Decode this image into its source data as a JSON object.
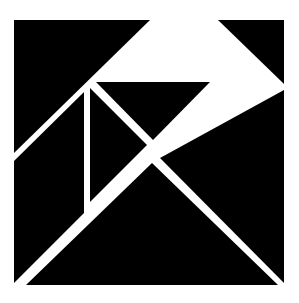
{
  "figure": {
    "canvas": {
      "width": 299,
      "height": 303,
      "background_color": "#ffffff",
      "piece_color": "#000000",
      "gap_color": "#ffffff"
    },
    "square_bounds": {
      "left": 9,
      "top": 13,
      "right": 288,
      "bottom": 290
    },
    "key_vertices": {
      "top_left": "9,13",
      "top_right": "288,13",
      "bottom_left": "9,290",
      "bottom_right": "288,290",
      "center": "152,152",
      "upper_notch": "90,85",
      "upper_right_vee": "215,78",
      "left_edge_notch": "9,155",
      "vertical_line_x": "78"
    },
    "pieces": [
      {
        "name": "large-triangle-upper-left",
        "label": "Large triangle (upper left)",
        "points": "14,20 150,20 14,153"
      },
      {
        "name": "medium-triangle-upper-right",
        "label": "Medium triangle (upper right)",
        "points": "218,20 284,20 284,84"
      },
      {
        "name": "small-triangle-top",
        "label": "Small triangle (top center)",
        "points": "96,82 210,82 153,140"
      },
      {
        "name": "parallelogram-left",
        "label": "Parallelogram (left column)",
        "points": "84,92 84,213 14,283 14,161"
      },
      {
        "name": "square-piece-center",
        "label": "Square piece (center)",
        "points": "90,88 147,145 90,202 90,202"
      },
      {
        "name": "large-triangle-lower-right",
        "label": "Large triangle (lower right)",
        "points": "284,90 284,283 160,158"
      },
      {
        "name": "medium-triangle-bottom",
        "label": "Medium triangle (bottom)",
        "points": "152,163 278,285 26,285"
      }
    ]
  }
}
